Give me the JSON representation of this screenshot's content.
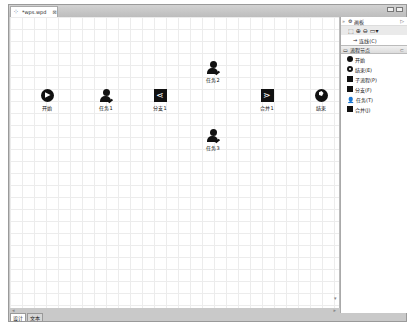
{
  "editor": {
    "tab_title": "*wps.wpd",
    "tab_close": "⊠"
  },
  "canvas": {
    "nodes": [
      {
        "id": "start",
        "label": "开始",
        "type": "start",
        "x": 37,
        "y": 88
      },
      {
        "id": "task1",
        "label": "任务1",
        "type": "task",
        "x": 96,
        "y": 88
      },
      {
        "id": "fork1",
        "label": "分支1",
        "type": "fork",
        "x": 150,
        "y": 88
      },
      {
        "id": "task2",
        "label": "任务2",
        "type": "task",
        "x": 203,
        "y": 60
      },
      {
        "id": "join1",
        "label": "合并1",
        "type": "join",
        "x": 257,
        "y": 88
      },
      {
        "id": "end",
        "label": "结束",
        "type": "end",
        "x": 311,
        "y": 88
      },
      {
        "id": "task3",
        "label": "任务3",
        "type": "task",
        "x": 203,
        "y": 128
      }
    ]
  },
  "bottom_tabs": [
    {
      "label": "设计",
      "active": true
    },
    {
      "label": "文本",
      "active": false
    }
  ],
  "palette": {
    "title": "画板",
    "expand_arrow": "▷",
    "tools": [
      "select-tool",
      "zoom-in-tool",
      "zoom-out-tool",
      "marquee-tool"
    ],
    "connection_label": "连线(C)",
    "drawer_title": "流程节点",
    "items": [
      {
        "label": "开始",
        "icon": "start-icon"
      },
      {
        "label": "结束(E)",
        "icon": "end-icon"
      },
      {
        "label": "子流程(P)",
        "icon": "subprocess-icon"
      },
      {
        "label": "分支(F)",
        "icon": "fork-icon"
      },
      {
        "label": "任务(T)",
        "icon": "task-icon"
      },
      {
        "label": "合并(J)",
        "icon": "join-icon"
      }
    ]
  }
}
